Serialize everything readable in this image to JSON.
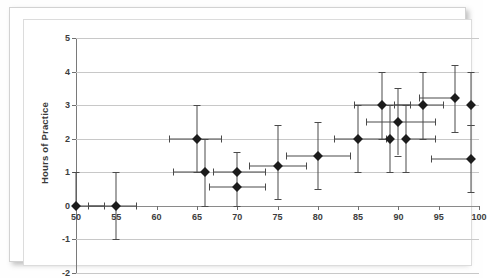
{
  "chart_data": {
    "type": "scatter",
    "title": "",
    "xlabel": "",
    "ylabel": "Hours of Practice",
    "xlim": [
      50,
      100
    ],
    "ylim": [
      -2,
      5
    ],
    "xticks": [
      50,
      55,
      60,
      65,
      70,
      75,
      80,
      85,
      90,
      95,
      100
    ],
    "yticks": [
      -2,
      -1,
      0,
      1,
      2,
      3,
      4,
      5
    ],
    "grid": "horizontal",
    "legend": "none",
    "has_error_bars": true,
    "points": [
      {
        "x": 50,
        "y": 0,
        "xerr_low": 0,
        "xerr_high": 3.5,
        "yerr_low": 0,
        "yerr_high": 1.0
      },
      {
        "x": 55,
        "y": 0,
        "xerr_low": 3.5,
        "xerr_high": 2.5,
        "yerr_low": 1.0,
        "yerr_high": 1.0
      },
      {
        "x": 65,
        "y": 2.0,
        "xerr_low": 3.5,
        "xerr_high": 3.0,
        "yerr_low": 1.0,
        "yerr_high": 1.0
      },
      {
        "x": 66,
        "y": 1.0,
        "xerr_low": 4.0,
        "xerr_high": 0,
        "yerr_low": 1.0,
        "yerr_high": 1.0
      },
      {
        "x": 70,
        "y": 1.0,
        "xerr_low": 3.0,
        "xerr_high": 3.5,
        "yerr_low": 1.0,
        "yerr_high": 0.6
      },
      {
        "x": 70,
        "y": 0.55,
        "xerr_low": 3.5,
        "xerr_high": 3.5,
        "yerr_low": 0,
        "yerr_high": 0
      },
      {
        "x": 75,
        "y": 1.2,
        "xerr_low": 3.5,
        "xerr_high": 3.5,
        "yerr_low": 1.0,
        "yerr_high": 1.2
      },
      {
        "x": 80,
        "y": 1.5,
        "xerr_low": 4.0,
        "xerr_high": 4.0,
        "yerr_low": 1.0,
        "yerr_high": 1.0
      },
      {
        "x": 85,
        "y": 2.0,
        "xerr_low": 3.0,
        "xerr_high": 3.5,
        "yerr_low": 1.0,
        "yerr_high": 1.0
      },
      {
        "x": 88,
        "y": 3.0,
        "xerr_low": 3.5,
        "xerr_high": 3.5,
        "yerr_low": 1.0,
        "yerr_high": 1.0
      },
      {
        "x": 89,
        "y": 2.0,
        "xerr_low": 0,
        "xerr_high": 0,
        "yerr_low": 1.0,
        "yerr_high": 1.0
      },
      {
        "x": 90,
        "y": 2.5,
        "xerr_low": 4.0,
        "xerr_high": 4.5,
        "yerr_low": 1.0,
        "yerr_high": 1.0
      },
      {
        "x": 91,
        "y": 2.0,
        "xerr_low": 0,
        "xerr_high": 3.5,
        "yerr_low": 1.0,
        "yerr_high": 1.0
      },
      {
        "x": 93,
        "y": 3.0,
        "xerr_low": 3.5,
        "xerr_high": 2.5,
        "yerr_low": 1.0,
        "yerr_high": 1.0
      },
      {
        "x": 97,
        "y": 3.2,
        "xerr_low": 4.5,
        "xerr_high": 0,
        "yerr_low": 1.0,
        "yerr_high": 1.0
      },
      {
        "x": 99,
        "y": 3.0,
        "xerr_low": 0,
        "xerr_high": 0,
        "yerr_low": 0.6,
        "yerr_high": 1.0
      },
      {
        "x": 99,
        "y": 1.4,
        "xerr_low": 5.0,
        "xerr_high": 0,
        "yerr_low": 1.0,
        "yerr_high": 1.0
      }
    ]
  }
}
